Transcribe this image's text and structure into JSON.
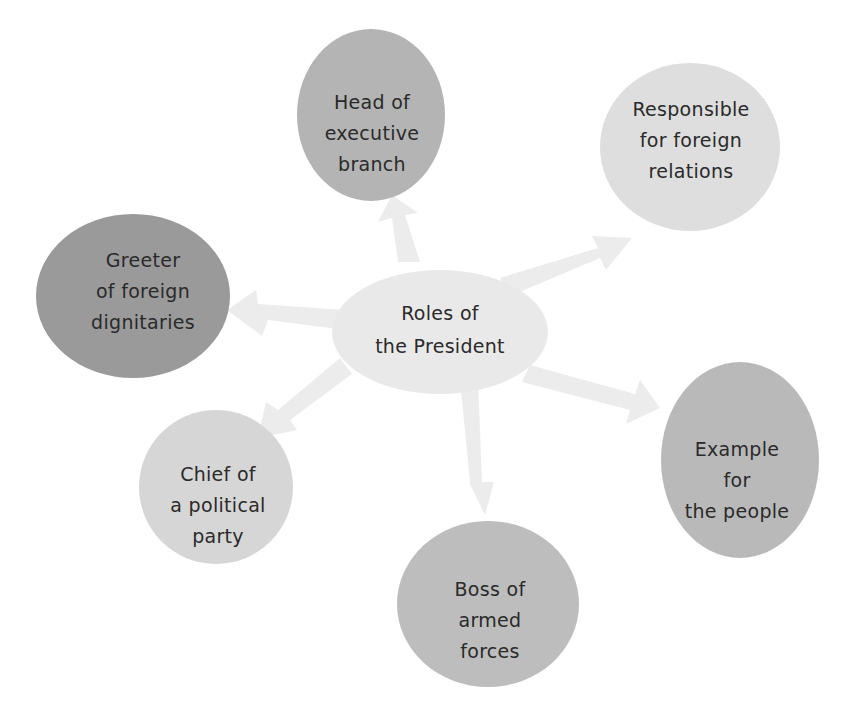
{
  "diagram": {
    "title": "Roles of the President",
    "center": {
      "lines": [
        "Roles of",
        "the President"
      ],
      "color": "#e9e9e9"
    },
    "nodes": [
      {
        "id": "head-of-executive-branch",
        "lines": [
          "Head of",
          "executive",
          "branch"
        ],
        "color": "#b4b4b4"
      },
      {
        "id": "responsible-for-foreign-relations",
        "lines": [
          "Responsible",
          "for foreign",
          "relations"
        ],
        "color": "#dedede"
      },
      {
        "id": "greeter-of-foreign-dignitaries",
        "lines": [
          "Greeter",
          "of foreign",
          "dignitaries"
        ],
        "color": "#9a9a9a"
      },
      {
        "id": "example-for-the-people",
        "lines": [
          "Example",
          "for",
          "the people"
        ],
        "color": "#b9b9b9"
      },
      {
        "id": "chief-of-a-political-party",
        "lines": [
          "Chief of",
          "a political",
          "party"
        ],
        "color": "#d6d6d6"
      },
      {
        "id": "boss-of-armed-forces",
        "lines": [
          "Boss of",
          "armed",
          "forces"
        ],
        "color": "#bdbdbd"
      }
    ],
    "arrow_color": "#ececec",
    "text_color": "#2a2a2a"
  }
}
